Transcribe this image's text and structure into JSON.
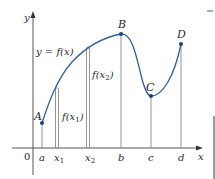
{
  "diagram": {
    "axes": {
      "x_label": "x",
      "y_label": "y",
      "origin_label": "0"
    },
    "curve_label": "y = f(x)",
    "points": [
      {
        "label": "A",
        "x_label": "a"
      },
      {
        "label": "B",
        "x_label": "b"
      },
      {
        "label": "C",
        "x_label": "c"
      },
      {
        "label": "D",
        "x_label": "d"
      }
    ],
    "sample_points": [
      {
        "x_label": "x",
        "x_sub": "1",
        "value_label": "f(x",
        "value_sub": "1",
        "value_close": ")"
      },
      {
        "x_label": "x",
        "x_sub": "2",
        "value_label": "f(x",
        "value_sub": "2",
        "value_close": ")"
      }
    ],
    "colors": {
      "curve": "#2f5fa8",
      "point": "#1e3f7a",
      "axis": "#555555",
      "guide": "#888888"
    }
  }
}
